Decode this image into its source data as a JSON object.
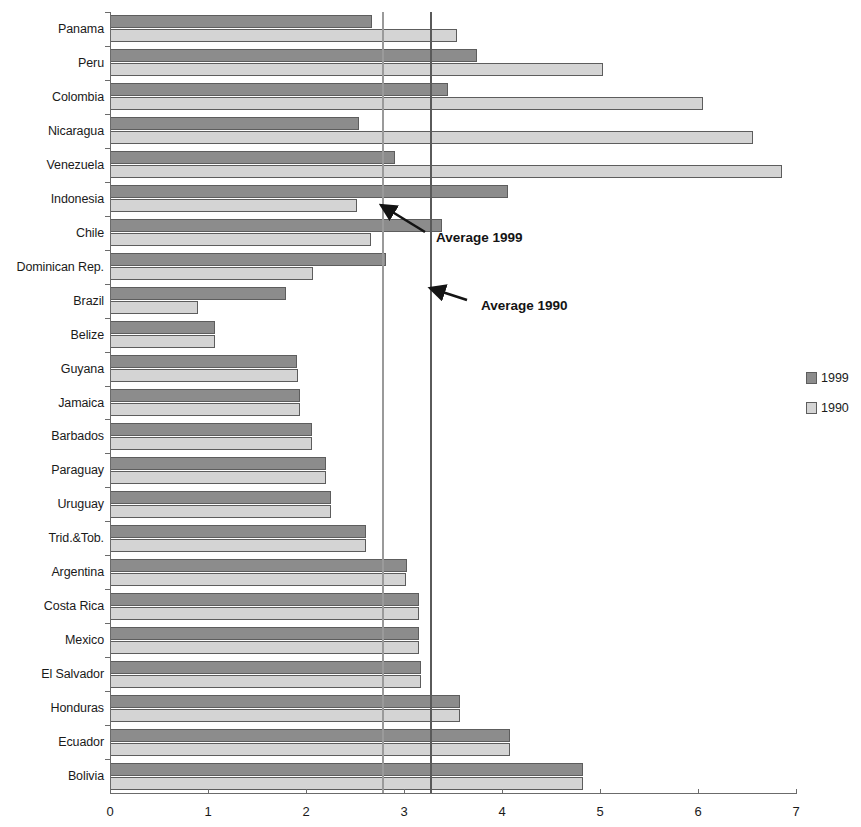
{
  "chart_data": {
    "type": "bar",
    "orientation": "horizontal",
    "title": "",
    "xlabel": "",
    "ylabel": "",
    "xlim": [
      0,
      7
    ],
    "xticks": [
      0,
      1,
      2,
      3,
      4,
      5,
      6,
      7
    ],
    "xtick_labels": [
      "0",
      "1",
      "2",
      "3",
      "4",
      "5",
      "6",
      "7"
    ],
    "grid": false,
    "legend_position": "right",
    "categories": [
      "Panama",
      "Peru",
      "Colombia",
      "Nicaragua",
      "Venezuela",
      "Indonesia",
      "Chile",
      "Dominican Rep.",
      "Brazil",
      "Belize",
      "Guyana",
      "Jamaica",
      "Barbados",
      "Paraguay",
      "Uruguay",
      "Trid.&Tob.",
      "Argentina",
      "Costa Rica",
      "Mexico",
      "El Salvador",
      "Honduras",
      "Ecuador",
      "Bolivia"
    ],
    "series": [
      {
        "name": "1999",
        "color": "#8c8c8c",
        "values": [
          2.67,
          3.74,
          3.45,
          2.54,
          2.91,
          4.06,
          3.39,
          2.82,
          1.8,
          1.07,
          1.91,
          1.94,
          2.06,
          2.2,
          2.26,
          2.61,
          3.03,
          3.15,
          3.15,
          3.17,
          3.57,
          4.08,
          4.83
        ]
      },
      {
        "name": "1990",
        "color": "#d4d4d4",
        "values": [
          3.54,
          5.03,
          6.05,
          6.56,
          6.86,
          2.52,
          2.66,
          2.07,
          0.9,
          1.07,
          1.92,
          1.94,
          2.06,
          2.2,
          2.26,
          2.61,
          3.02,
          3.15,
          3.15,
          3.17,
          3.57,
          4.08,
          4.83
        ]
      }
    ],
    "reference_lines": [
      {
        "label": "Average 1999",
        "value": 2.78,
        "color": "#9a9a9a"
      },
      {
        "label": "Average 1990",
        "value": 3.27,
        "color": "#5a5a5a"
      }
    ]
  },
  "legend": {
    "entries": [
      {
        "label": "1999",
        "swatch": "dark-gray"
      },
      {
        "label": "1990",
        "swatch": "light-gray"
      }
    ]
  },
  "annotations": [
    {
      "label": "Average 1999"
    },
    {
      "label": "Average 1990"
    }
  ]
}
